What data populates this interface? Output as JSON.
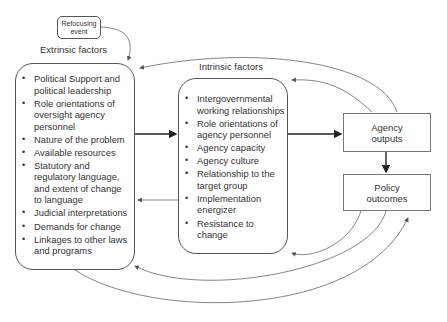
{
  "diagram": {
    "type": "flow",
    "refocusing_event": {
      "line1": "Refocusing",
      "line2": "event"
    },
    "extrinsic": {
      "title": "Extrinsic factors",
      "items": [
        "Political Support and political leadership",
        "Role orientations of oversight agency personnel",
        "Nature of the problem",
        "Available resources",
        "Statutory and regulatory language, and extent of change to language",
        "Judicial interpretations",
        "Demands for change",
        "Linkages to other laws and programs"
      ]
    },
    "intrinsic": {
      "title": "Intrinsic factors",
      "items": [
        "Intergovernmental working relationships",
        "Role orientations of agency personnel",
        "Agency capacity",
        "Agency culture",
        "Relationship to the target group",
        "Implementation energizer",
        "Resistance to change"
      ]
    },
    "agency_outputs": {
      "line1": "Agency",
      "line2": "outputs"
    },
    "policy_outcomes": {
      "line1": "Policy",
      "line2": "outcomes"
    },
    "colors": {
      "stroke": "#555555",
      "text": "#333333",
      "background": "#ffffff"
    },
    "edges": [
      {
        "from": "Refocusing event",
        "to": "Extrinsic factors"
      },
      {
        "from": "Extrinsic factors",
        "to": "Intrinsic factors"
      },
      {
        "from": "Intrinsic factors",
        "to": "Extrinsic factors"
      },
      {
        "from": "Intrinsic factors",
        "to": "Agency outputs"
      },
      {
        "from": "Agency outputs",
        "to": "Policy outcomes"
      },
      {
        "from": "Agency outputs",
        "to": "Extrinsic factors"
      },
      {
        "from": "Agency outputs",
        "to": "Intrinsic factors"
      },
      {
        "from": "Policy outcomes",
        "to": "Intrinsic factors"
      },
      {
        "from": "Policy outcomes",
        "to": "Extrinsic factors"
      },
      {
        "from": "Extrinsic factors",
        "to": "Policy outcomes"
      }
    ]
  }
}
